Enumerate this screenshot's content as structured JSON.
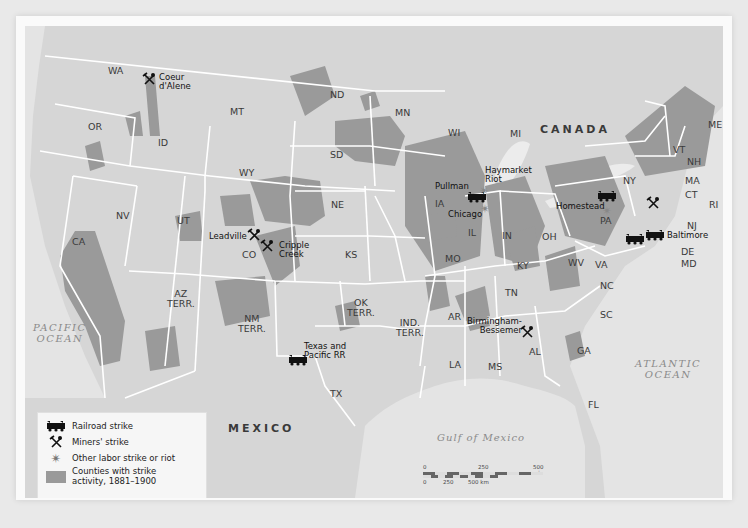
{
  "map": {
    "title": "Labor Strikes, 1881–1900",
    "colors": {
      "land": "#d6d6d6",
      "strike_counties": "#9a9a9a",
      "water": "#e6e6e6",
      "borders": "#ffffff",
      "frame": "#fafafa"
    },
    "countries": {
      "canada": "CANADA",
      "mexico": "MEXICO"
    },
    "water_bodies": {
      "pacific": "PACIFIC\nOCEAN",
      "atlantic": "ATLANTIC\nOCEAN",
      "gulf": "Gulf of Mexico"
    },
    "states": {
      "WA": "WA",
      "OR": "OR",
      "CA": "CA",
      "ID": "ID",
      "NV": "NV",
      "MT": "MT",
      "WY": "WY",
      "UT": "UT",
      "CO": "CO",
      "AZ": "AZ\nTERR.",
      "NM": "NM\nTERR.",
      "ND": "ND",
      "SD": "SD",
      "NE": "NE",
      "KS": "KS",
      "OK": "OK\nTERR.",
      "IND": "IND.\nTERR.",
      "TX": "TX",
      "MN": "MN",
      "IA": "IA",
      "MO": "MO",
      "AR": "AR",
      "LA": "LA",
      "WI": "WI",
      "IL": "IL",
      "MI": "MI",
      "IN": "IN",
      "OH": "OH",
      "KY": "KY",
      "TN": "TN",
      "MS": "MS",
      "AL": "AL",
      "GA": "GA",
      "FL": "FL",
      "SC": "SC",
      "NC": "NC",
      "VA": "VA",
      "WV": "WV",
      "PA": "PA",
      "NY": "NY",
      "VT": "VT",
      "NH": "NH",
      "ME": "ME",
      "MA": "MA",
      "CT": "CT",
      "RI": "RI",
      "NJ": "NJ",
      "DE": "DE",
      "MD": "MD"
    },
    "events": [
      {
        "name": "Coeur d'Alene",
        "label": "Coeur\nd'Alene",
        "type": "miners-strike"
      },
      {
        "name": "Leadville",
        "label": "Leadville",
        "type": "miners-strike"
      },
      {
        "name": "Cripple Creek",
        "label": "Cripple\nCreek",
        "type": "miners-strike"
      },
      {
        "name": "Texas and Pacific RR",
        "label": "Texas and\nPacific RR",
        "type": "railroad-strike"
      },
      {
        "name": "Pullman",
        "label": "Pullman",
        "type": "railroad-strike"
      },
      {
        "name": "Chicago",
        "label": "Chicago",
        "type": "other-labor-strike"
      },
      {
        "name": "Haymarket Riot",
        "label": "Haymarket\nRiot",
        "type": "other-labor-strike"
      },
      {
        "name": "Homestead",
        "label": "Homestead",
        "type": "other-labor-strike"
      },
      {
        "name": "Pennsylvania railroad",
        "label": "",
        "type": "railroad-strike"
      },
      {
        "name": "Pennsylvania mines",
        "label": "",
        "type": "miners-strike"
      },
      {
        "name": "Baltimore",
        "label": "Baltimore",
        "type": "railroad-strike"
      },
      {
        "name": "Birmingham-Bessemer",
        "label": "Birmingham-\nBessemer",
        "type": "miners-strike"
      }
    ],
    "legend": {
      "items": [
        {
          "icon": "railroad-strike-icon",
          "label": "Railroad strike"
        },
        {
          "icon": "miners-strike-icon",
          "label": "Miners' strike"
        },
        {
          "icon": "other-strike-icon",
          "label": "Other labor strike or riot"
        },
        {
          "icon": "county-swatch",
          "label": "Counties with strike\nactivity, 1881–1900"
        }
      ]
    },
    "scale": {
      "mi_ticks": [
        "0",
        "250",
        "500 mi"
      ],
      "km_ticks": [
        "0",
        "250",
        "500 km"
      ]
    }
  }
}
